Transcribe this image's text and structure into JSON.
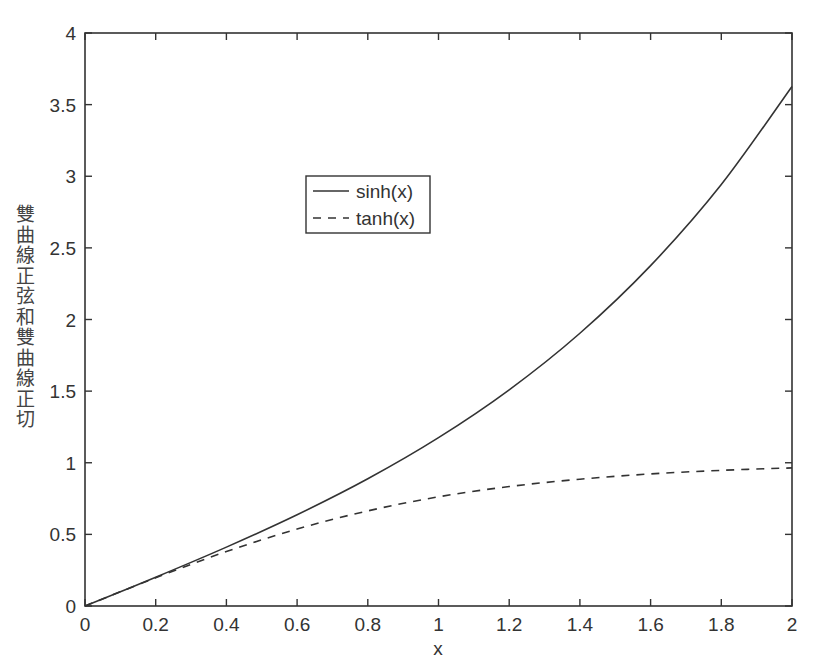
{
  "chart_data": {
    "type": "line",
    "title": "",
    "xlabel": "x",
    "ylabel": "雙曲線正弦和雙曲線正切",
    "xlim": [
      0,
      2
    ],
    "ylim": [
      0,
      4
    ],
    "xticks": [
      "0",
      "0.2",
      "0.4",
      "0.6",
      "0.8",
      "1",
      "1.2",
      "1.4",
      "1.6",
      "1.8",
      "2"
    ],
    "yticks": [
      "0",
      "0.5",
      "1",
      "1.5",
      "2",
      "2.5",
      "3",
      "3.5",
      "4"
    ],
    "grid": false,
    "legend_position": "inside upper-left-center",
    "x": [
      0,
      0.2,
      0.4,
      0.6,
      0.8,
      1.0,
      1.2,
      1.4,
      1.6,
      1.8,
      2.0
    ],
    "series": [
      {
        "name": "sinh(x)",
        "style": "solid",
        "values": [
          0,
          0.201,
          0.411,
          0.637,
          0.888,
          1.175,
          1.509,
          1.904,
          2.376,
          2.942,
          3.627
        ]
      },
      {
        "name": "tanh(x)",
        "style": "dashed",
        "values": [
          0,
          0.197,
          0.38,
          0.537,
          0.664,
          0.762,
          0.834,
          0.885,
          0.922,
          0.947,
          0.964
        ]
      }
    ]
  },
  "legend": {
    "items": [
      "sinh(x)",
      "tanh(x)"
    ]
  },
  "colors": {
    "line": "#333333",
    "axis": "#333333",
    "background": "#ffffff"
  }
}
